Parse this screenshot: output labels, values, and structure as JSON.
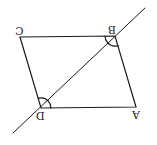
{
  "diagram": {
    "type": "parallelogram-with-transversal",
    "orientation": "rotated 180 degrees",
    "stroke_color": "#1a1a1a",
    "vertices": {
      "A": {
        "label": "A",
        "x": 136,
        "y": 107
      },
      "B": {
        "label": "B",
        "x": 115,
        "y": 36
      },
      "C": {
        "label": "C",
        "x": 20,
        "y": 37
      },
      "D": {
        "label": "D",
        "x": 41,
        "y": 108
      }
    },
    "sides": [
      "AB",
      "BC",
      "CD",
      "DA"
    ],
    "transversal": {
      "through": [
        "D",
        "B"
      ],
      "from": {
        "x": 13,
        "y": 133
      },
      "to": {
        "x": 145,
        "y": 8
      }
    },
    "angle_marks": [
      {
        "vertex": "B",
        "count": 2
      },
      {
        "vertex": "D",
        "count": 2
      }
    ]
  }
}
